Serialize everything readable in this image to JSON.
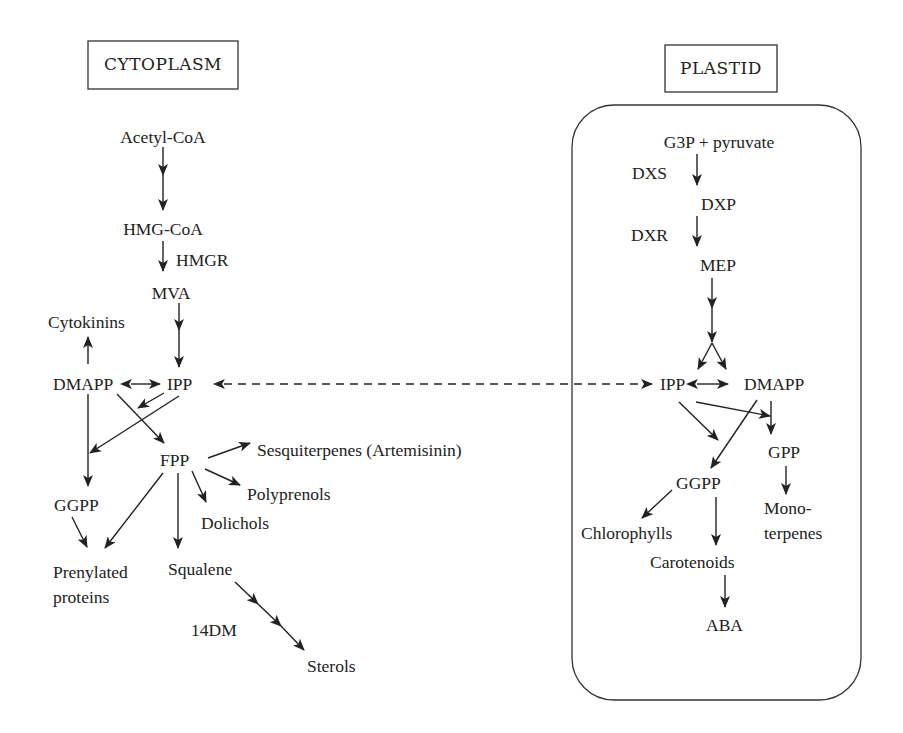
{
  "diagram": {
    "compartments": {
      "cytoplasm": {
        "label": "CYTOPLASM"
      },
      "plastid": {
        "label": "PLASTID"
      }
    },
    "cytoplasm_nodes": {
      "acetyl_coa": "Acetyl-CoA",
      "hmg_coa": "HMG-CoA",
      "hmgr": "HMGR",
      "mva": "MVA",
      "cytokinins": "Cytokinins",
      "dmapp": "DMAPP",
      "ipp": "IPP",
      "fpp": "FPP",
      "sesquiterpenes": "Sesquiterpenes (Artemisinin)",
      "polyprenols": "Polyprenols",
      "dolichols": "Dolichols",
      "ggpp": "GGPP",
      "prenylated_line1": "Prenylated",
      "prenylated_line2": "proteins",
      "squalene": "Squalene",
      "dm14": "14DM",
      "sterols": "Sterols"
    },
    "plastid_nodes": {
      "g3p_pyruvate": "G3P + pyruvate",
      "dxs": "DXS",
      "dxp": "DXP",
      "dxr": "DXR",
      "mep": "MEP",
      "ipp": "IPP",
      "dmapp": "DMAPP",
      "gpp": "GPP",
      "ggpp": "GGPP",
      "monoterpenes_line1": "Mono-",
      "monoterpenes_line2": "terpenes",
      "chlorophylls": "Chlorophylls",
      "carotenoids": "Carotenoids",
      "aba": "ABA"
    },
    "edges": [
      {
        "from": "Acetyl-CoA",
        "to": "HMG-CoA"
      },
      {
        "from": "HMG-CoA",
        "to": "MVA",
        "enzyme": "HMGR"
      },
      {
        "from": "MVA",
        "to": "IPP"
      },
      {
        "from": "DMAPP",
        "to": "IPP",
        "bidirectional": true
      },
      {
        "from": "DMAPP",
        "to": "Cytokinins"
      },
      {
        "from": "DMAPP",
        "to": "FPP"
      },
      {
        "from": "IPP",
        "to": "FPP"
      },
      {
        "from": "IPP",
        "to": "GGPP"
      },
      {
        "from": "DMAPP",
        "to": "GGPP"
      },
      {
        "from": "GGPP",
        "to": "Prenylated proteins"
      },
      {
        "from": "FPP",
        "to": "Prenylated proteins"
      },
      {
        "from": "FPP",
        "to": "Sesquiterpenes (Artemisinin)"
      },
      {
        "from": "FPP",
        "to": "Polyprenols"
      },
      {
        "from": "FPP",
        "to": "Dolichols"
      },
      {
        "from": "FPP",
        "to": "Squalene"
      },
      {
        "from": "Squalene",
        "to": "Sterols",
        "enzyme": "14DM"
      },
      {
        "from": "Plastid IPP",
        "to": "Cytoplasm IPP",
        "bidirectional": true,
        "style": "dashed"
      },
      {
        "from": "G3P + pyruvate",
        "to": "DXP",
        "enzyme": "DXS"
      },
      {
        "from": "DXP",
        "to": "MEP",
        "enzyme": "DXR"
      },
      {
        "from": "MEP",
        "to": "IPP"
      },
      {
        "from": "MEP",
        "to": "DMAPP"
      },
      {
        "from": "IPP",
        "to": "DMAPP",
        "bidirectional": true
      },
      {
        "from": "IPP",
        "to": "GPP"
      },
      {
        "from": "DMAPP",
        "to": "GPP"
      },
      {
        "from": "IPP",
        "to": "GGPP"
      },
      {
        "from": "DMAPP",
        "to": "GGPP"
      },
      {
        "from": "GPP",
        "to": "Monoterpenes"
      },
      {
        "from": "GGPP",
        "to": "Chlorophylls"
      },
      {
        "from": "GGPP",
        "to": "Carotenoids"
      },
      {
        "from": "Carotenoids",
        "to": "ABA"
      }
    ],
    "colors": {
      "ink": "#222222",
      "background": "#ffffff"
    }
  }
}
